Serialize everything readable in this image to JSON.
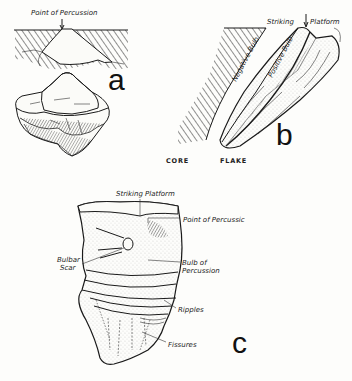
{
  "diagram": {
    "panels": [
      {
        "id": "a",
        "letter": "a",
        "labels": {
          "point_of_percussion": "Point of Percussion"
        }
      },
      {
        "id": "b",
        "letter": "b",
        "labels": {
          "striking": "Striking",
          "platform": "Platform",
          "negative_bulb": "Negative Bulb",
          "positive_bulb": "Positive Bulb",
          "core": "CORE",
          "flake": "FLAKE"
        }
      },
      {
        "id": "c",
        "letter": "c",
        "labels": {
          "striking_platform": "Striking Platform",
          "point_of_percussion": "Point of Percussic",
          "bulbar_scar_1": "Bulbar",
          "bulbar_scar_2": "Scar",
          "bulb_of_1": "Bulb of",
          "bulb_of_2": "Percussion",
          "ripples": "Ripples",
          "fissures": "Fissures"
        }
      }
    ],
    "colors": {
      "ink": "#1a1a1a",
      "paper": "#fdfdfb"
    }
  }
}
